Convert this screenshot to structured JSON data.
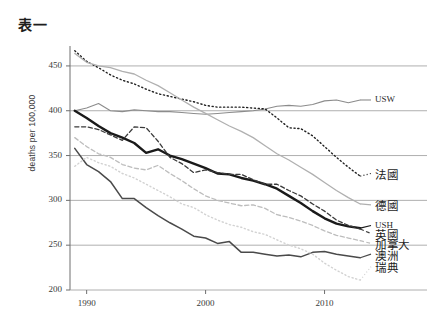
{
  "title": "表一",
  "chart_data": {
    "type": "line",
    "title": "表一",
    "xlabel": "",
    "ylabel": "deaths per 100,000",
    "xlim": [
      1988.6,
      2013.4
    ],
    "ylim": [
      200,
      470
    ],
    "xticks": [
      1990,
      2000,
      2010
    ],
    "yticks": [
      200,
      250,
      300,
      350,
      400,
      450
    ],
    "grid": "horizontal",
    "legend_position": "right-edge-inline",
    "x": [
      1989,
      1990,
      1991,
      1992,
      1993,
      1994,
      1995,
      1996,
      1997,
      1998,
      1999,
      2000,
      2001,
      2002,
      2003,
      2004,
      2005,
      2006,
      2007,
      2008,
      2009,
      2010,
      2011,
      2012,
      2013
    ],
    "series": [
      {
        "name": "USW",
        "label": "USW",
        "style": "solid",
        "color": "#8c8c8c",
        "width": 1.1,
        "label_y_value": 412,
        "values": [
          400,
          403,
          408,
          400,
          399,
          401,
          400,
          399,
          399,
          398,
          397,
          396,
          397,
          398,
          399,
          400,
          402,
          405,
          406,
          405,
          407,
          411,
          412,
          409,
          412
        ]
      },
      {
        "name": "France",
        "label": "法國",
        "style": "dotted",
        "color": "#1f1f1f",
        "width": 1.4,
        "label_y_value": 330,
        "values": [
          467,
          455,
          448,
          440,
          434,
          430,
          424,
          419,
          416,
          413,
          410,
          406,
          404,
          404,
          404,
          403,
          402,
          392,
          381,
          380,
          372,
          360,
          348,
          337,
          327
        ]
      },
      {
        "name": "Germany",
        "label": "德國",
        "style": "solid",
        "color": "#b0b0b0",
        "width": 1.3,
        "label_y_value": 295,
        "values": [
          464,
          454,
          450,
          448,
          444,
          441,
          434,
          428,
          420,
          412,
          404,
          397,
          390,
          383,
          377,
          370,
          361,
          352,
          345,
          337,
          329,
          320,
          311,
          303,
          296
        ]
      },
      {
        "name": "USH",
        "label": "USH",
        "style": "solid",
        "color": "#1a1a1a",
        "width": 2.4,
        "label_y_value": 272,
        "values": [
          400,
          392,
          383,
          375,
          370,
          364,
          353,
          357,
          350,
          346,
          341,
          336,
          330,
          329,
          325,
          322,
          318,
          313,
          305,
          297,
          288,
          280,
          274,
          271,
          269
        ]
      },
      {
        "name": "UK",
        "label": "英國",
        "style": "dashed",
        "color": "#3a3a3a",
        "width": 1.3,
        "label_y_value": 263,
        "values": [
          382,
          382,
          379,
          373,
          367,
          382,
          381,
          366,
          348,
          341,
          331,
          334,
          331,
          329,
          329,
          323,
          318,
          318,
          311,
          305,
          296,
          288,
          278,
          272,
          268
        ]
      },
      {
        "name": "Canada",
        "label": "加拿大",
        "style": "dashed",
        "color": "#bdbdbd",
        "width": 1.3,
        "label_y_value": 252,
        "values": [
          370,
          360,
          352,
          348,
          340,
          336,
          334,
          339,
          330,
          322,
          313,
          305,
          300,
          297,
          294,
          295,
          291,
          284,
          281,
          277,
          272,
          266,
          261,
          258,
          255
        ]
      },
      {
        "name": "Australia",
        "label": "澳洲",
        "style": "solid",
        "color": "#4a4a4a",
        "width": 1.5,
        "label_y_value": 240,
        "values": [
          358,
          340,
          332,
          321,
          302,
          302,
          292,
          283,
          275,
          268,
          260,
          258,
          252,
          254,
          242,
          242,
          240,
          238,
          239,
          237,
          242,
          243,
          240,
          238,
          236
        ]
      },
      {
        "name": "Sweden",
        "label": "瑞典",
        "style": "dotted",
        "color": "#d2d2d2",
        "width": 1.4,
        "label_y_value": 226,
        "values": [
          338,
          348,
          342,
          338,
          330,
          325,
          318,
          311,
          304,
          296,
          292,
          284,
          278,
          273,
          270,
          265,
          262,
          256,
          250,
          246,
          240,
          230,
          222,
          215,
          211
        ]
      }
    ]
  },
  "axis": {
    "y_title": "deaths per 100,000",
    "y_ticks": [
      "450",
      "400",
      "350",
      "300",
      "250",
      "200"
    ],
    "x_ticks": [
      "1990",
      "2000",
      "2010"
    ]
  },
  "labels": {
    "usw": "USW",
    "france": "法國",
    "germany": "德國",
    "ush": "USH",
    "uk": "英國",
    "canada": "加拿大",
    "australia": "澳洲",
    "sweden": "瑞典"
  }
}
